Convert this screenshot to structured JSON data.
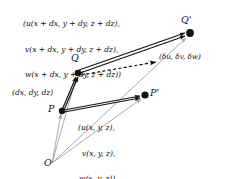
{
  "figure": {
    "colors": {
      "ink": "#111111",
      "position_vector": "#9a9a9a",
      "background": "#ffffff"
    },
    "points": {
      "origin": "O",
      "p": "P",
      "p_prime": "P'",
      "q": "Q",
      "q_prime": "Q'"
    },
    "annotations": {
      "separation_vector": "(dx, dy, dz)",
      "velocity_at_p": {
        "line1": "(u(x, y, z),",
        "line2": "v(x, y, z),",
        "line3": "w(x, y, z))"
      },
      "velocity_at_q": {
        "line1": "(u(x + dx, y + dy, z + dz),",
        "line2": "v(x + dx, y + dy, z + dz),",
        "line3": "w(x + dx, y + dy, z + dz))"
      },
      "velocity_difference": "(δu, δv, δw)"
    }
  }
}
